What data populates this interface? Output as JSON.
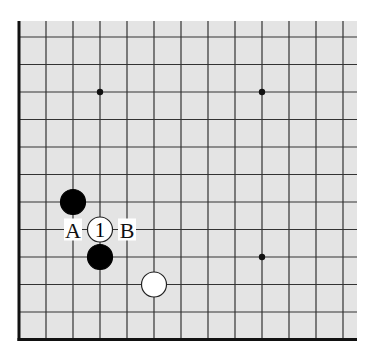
{
  "diagram": {
    "type": "go-board-corner",
    "board_size": 19,
    "visible_region": {
      "columns": "1-13",
      "rows": "1-12 (partial 13)"
    },
    "colors": {
      "board": "#e4e4e4",
      "grid": "#333333",
      "edge": "#111111",
      "black_stone": "#000000",
      "white_stone": "#ffffff",
      "label_bg": "#ffffff"
    },
    "star_points": [
      {
        "col": 4,
        "row": 10
      },
      {
        "col": 10,
        "row": 10
      },
      {
        "col": 10,
        "row": 4
      }
    ],
    "stones": [
      {
        "color": "black",
        "col": 3,
        "row": 6,
        "label": ""
      },
      {
        "color": "white",
        "col": 4,
        "row": 5,
        "label": "1"
      },
      {
        "color": "black",
        "col": 4,
        "row": 4,
        "label": ""
      },
      {
        "color": "white",
        "col": 6,
        "row": 3,
        "label": ""
      }
    ],
    "labels": [
      {
        "text": "A",
        "col": 3,
        "row": 5
      },
      {
        "text": "B",
        "col": 5,
        "row": 5
      }
    ]
  }
}
